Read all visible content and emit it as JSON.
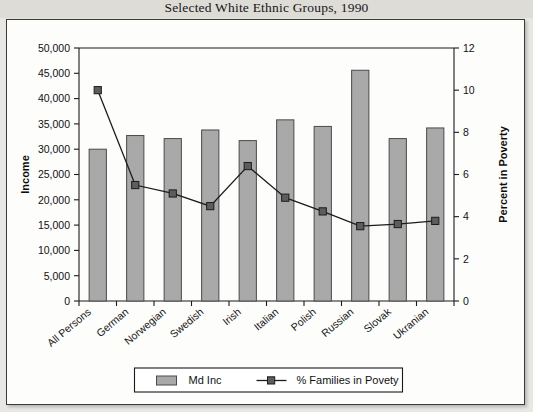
{
  "page": {
    "title": "Selected White Ethnic Groups, 1990"
  },
  "legend": {
    "bar_label": "Md Inc",
    "line_label": "% Families in Povety"
  },
  "axes": {
    "left_title": "Income",
    "right_title": "Percent in Poverty",
    "left_ticks": [
      "0",
      "5,000",
      "10,000",
      "15,000",
      "20,000",
      "25,000",
      "30,000",
      "35,000",
      "40,000",
      "45,000",
      "50,000"
    ],
    "right_ticks": [
      "0",
      "2",
      "4",
      "6",
      "8",
      "10",
      "12"
    ]
  },
  "colors": {
    "bar_fill": "#a9a9a9",
    "bar_stroke": "#4a4a4a",
    "line": "#1c1c1c",
    "marker": "#5d5d5d",
    "frame": "#3a3a3a",
    "page_background": "#e8e7e3",
    "plot_background": "#fdfdfc"
  },
  "chart_data": {
    "type": "bar",
    "title": "Selected White Ethnic Groups, 1990",
    "xlabel": "",
    "ylabel": "Income",
    "y2label": "Percent in Poverty",
    "ylim": [
      0,
      50000
    ],
    "y2lim": [
      0,
      12
    ],
    "ytick_step": 5000,
    "y2tick_step": 2,
    "grid": false,
    "legend_position": "bottom",
    "categories": [
      "All Persons",
      "German",
      "Norwegian",
      "Swedish",
      "Irish",
      "Italian",
      "Polish",
      "Russian",
      "Slovak",
      "Ukranian"
    ],
    "series": [
      {
        "name": "Md Inc",
        "type": "bar",
        "axis": "left",
        "values": [
          30000,
          32700,
          32100,
          33800,
          31700,
          35800,
          34500,
          45600,
          32100,
          34200
        ]
      },
      {
        "name": "% Families in Povety",
        "type": "line",
        "axis": "right",
        "values": [
          10.0,
          5.5,
          5.1,
          4.5,
          6.4,
          4.9,
          4.25,
          3.55,
          3.65,
          3.8
        ]
      }
    ]
  }
}
